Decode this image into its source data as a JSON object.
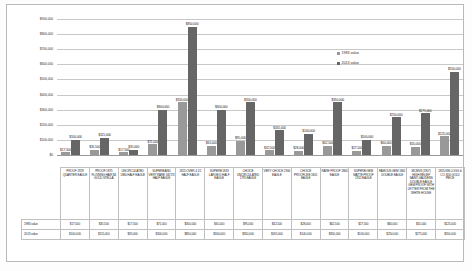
{
  "chart_data": {
    "type": "bar",
    "title": "",
    "xlabel": "",
    "ylabel": "",
    "ylim": [
      0,
      900000
    ],
    "grid": true,
    "legend_position": "inside-top-right",
    "yticks": [
      "$0",
      "$100,000",
      "$200,000",
      "$300,000",
      "$400,000",
      "$500,000",
      "$600,000",
      "$700,000",
      "$800,000",
      "$900,000"
    ],
    "categories": [
      "PROOF 1929 QUARTER EAGLE",
      "PROOF 1875 FLOWING HAIR $4 GOLD STELLA",
      "UNCIRCULATED 1880 HALF EAGLE",
      "SUPERB AND VERY RARE 1827/3 HALF EAGLE",
      "1825 OVER 4 1/1 HALF EAGLE",
      "SUPERB 1833 LARGE D HALF EAGLE",
      "CHOICE UNCIRCULATED 1795 EAGLE",
      "VERY CHOICE 1906 EAGLE",
      "CHOICE PROOFLIKE 1801 EAGLE",
      "RARE PROOF 1866 EAGLE",
      "SUPERB GEM MATTE PROOF 1912 EAGLE",
      "FAMOUS GEM 1861 DOUBLE EAGLE",
      "MCMVII (1907) HIGH RELIEF SAINT-GAUDENS DOUBLE EAGLE GEM PROOF WITH LETTER FROM THE WHITE HOUSE",
      "1855 KELLOGG & CO. $50 GOLD PIECE"
    ],
    "series": [
      {
        "name": "1983 value",
        "color": "#999999",
        "values": [
          17500,
          35500,
          17500,
          71000,
          350000,
          61000,
          95000,
          32500,
          28000,
          62500,
          27500,
          60000,
          55000,
          125000
        ],
        "labels": [
          "$17,500",
          "$35,500",
          "$17,500",
          "$71,000",
          "$350,000",
          "$61,000",
          "$95,000",
          "$32,500",
          "$28,000",
          "$62,500",
          "$27,500",
          "$60,000",
          "$55,000",
          "$125,000"
        ]
      },
      {
        "name": "2013 value",
        "color": "#666666",
        "values": [
          100000,
          115000,
          35000,
          300000,
          850000,
          300000,
          350000,
          165000,
          140000,
          350000,
          100000,
          250000,
          275000,
          550000
        ],
        "labels": [
          "$100,000",
          "$115,000",
          "$35,000",
          "$300,000",
          "$850,000",
          "$300,000",
          "$350,000",
          "$165,000",
          "$140,000",
          "$350,000",
          "$100,000",
          "$250,000",
          "$275,000",
          "$550,000"
        ]
      }
    ]
  },
  "table": {
    "row_labels": [
      "1983 value",
      "2013 value"
    ]
  }
}
